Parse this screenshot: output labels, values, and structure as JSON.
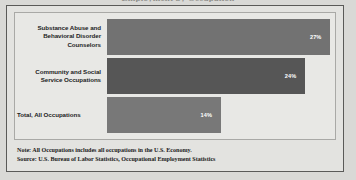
{
  "figure": {
    "cutoff_title": "Employment by Occupation",
    "background_color": "#e3e3e0",
    "border_color": "#5a5a58"
  },
  "chart_data": {
    "type": "bar",
    "orientation": "horizontal",
    "title": "",
    "xlabel": "",
    "ylabel": "",
    "xlim": [
      0,
      30
    ],
    "grid": false,
    "legend": null,
    "categories": [
      "Substance Abuse and Behavioral Disorder Counselors",
      "Community and Social Service Occupations",
      "Total, All Occupations"
    ],
    "values": [
      27,
      24,
      14
    ],
    "value_labels": [
      "27%",
      "24%",
      "14%"
    ],
    "bar_colors": [
      "#727272",
      "#565656",
      "#787878"
    ],
    "bar_label_color": "#ffffff"
  },
  "bars": [
    {
      "label_line_1": "Substance Abuse and",
      "label_line_2": "Behavioral Disorder",
      "label_line_3": "Counselors",
      "value_label": "27%",
      "width_pct": 98,
      "color": "#727272"
    },
    {
      "label_line_1": "Community and Social",
      "label_line_2": "Service Occupations",
      "label_line_3": "",
      "value_label": "24%",
      "width_pct": 87,
      "color": "#565656"
    },
    {
      "label_line_1": "Total, All Occupations",
      "label_line_2": "",
      "label_line_3": "",
      "value_label": "14%",
      "width_pct": 50,
      "color": "#787878"
    }
  ],
  "notes": {
    "note_line": "Note: All Occupations includes all occupations in the U.S. Economy.",
    "source_line": "Source: U.S. Bureau of Labor Statistics, Occupational Employment Statistics"
  }
}
